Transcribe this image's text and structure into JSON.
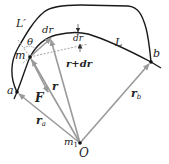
{
  "diagram": {
    "type": "physics-work-gravity-path",
    "colors": {
      "curve": "#1a1a1a",
      "vector": "#9a9a9a",
      "dashed": "#8a8a8a",
      "text": "#222222",
      "point": "#111111"
    },
    "labels": {
      "L_prime": "L′",
      "L": "L",
      "theta": "θ",
      "dr": "dr",
      "dr_small": "dr",
      "m": "m",
      "r_plus_dr": "r+dr",
      "r": "r",
      "F": "F",
      "a": "a",
      "b": "b",
      "r_a": "r",
      "r_a_sub": "a",
      "r_b": "r",
      "r_b_sub": "b",
      "m1": "m",
      "m1_sub": "1",
      "O": "O"
    },
    "points": {
      "O": [
        80,
        143
      ],
      "a": [
        17,
        92
      ],
      "b": [
        151,
        62
      ],
      "m": [
        30,
        57
      ]
    }
  }
}
